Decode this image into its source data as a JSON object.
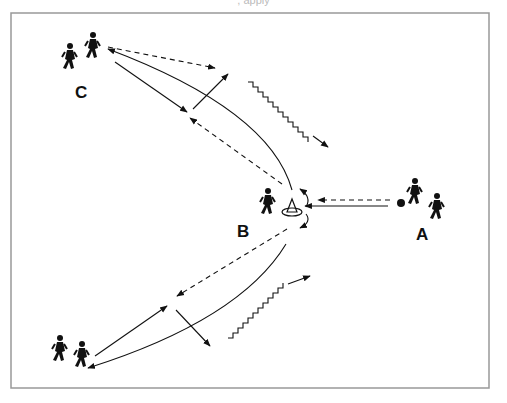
{
  "header": {
    "clipped_text": ", apply"
  },
  "diagram": {
    "type": "soccer drill",
    "frame_color": "#999999",
    "ink_color": "#111111",
    "groups": [
      {
        "id": "A",
        "label": "A",
        "players": 2,
        "has_ball": true
      },
      {
        "id": "B",
        "label": "B",
        "players": 1,
        "has_cone": true
      },
      {
        "id": "C",
        "label": "C",
        "players": 2
      },
      {
        "id": "D",
        "label": "",
        "players": 2
      }
    ],
    "legend": {
      "solid_arrow": "run / player movement",
      "dashed_arrow": "pass",
      "zigzag_arrow": "dribble"
    }
  }
}
